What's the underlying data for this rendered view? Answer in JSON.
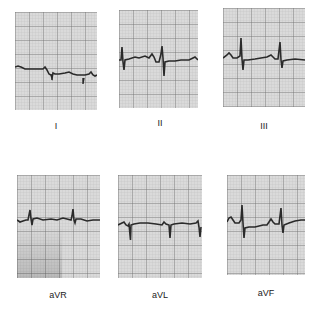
{
  "figure": {
    "leads": [
      {
        "name": "I",
        "label": "I"
      },
      {
        "name": "II",
        "label": "II"
      },
      {
        "name": "III",
        "label": "III"
      },
      {
        "name": "aVR",
        "label": "aVR"
      },
      {
        "name": "aVL",
        "label": "aVL"
      },
      {
        "name": "aVF",
        "label": "aVF"
      }
    ]
  },
  "colors": {
    "grid_bg": "#d9d9d9",
    "grid_minor": "#b3b3b3",
    "grid_major": "#6e6e6e",
    "trace": "#2a2a2a"
  }
}
